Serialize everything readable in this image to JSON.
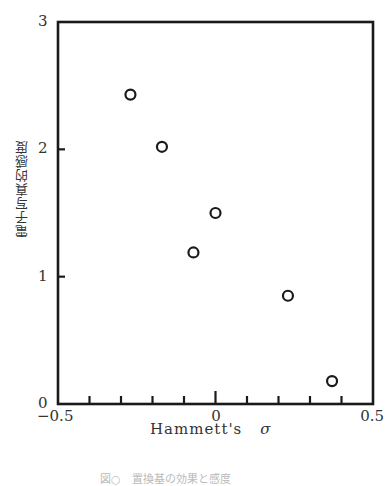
{
  "chart_data": {
    "type": "scatter",
    "title": "",
    "xlabel": "Hammett's σ",
    "xlabel_text": "Hammett's",
    "xlabel_symbol": "σ",
    "ylabel": "電子写真的感度",
    "xlim": [
      -0.5,
      0.5
    ],
    "ylim": [
      0,
      3
    ],
    "x_tick_labels": [
      "−0.5",
      "0",
      "0.5"
    ],
    "x_tick_values": [
      -0.5,
      0,
      0.5
    ],
    "x_minor_ticks": [
      -0.4,
      -0.3,
      -0.2,
      -0.1,
      0,
      0.1,
      0.2,
      0.3,
      0.4
    ],
    "y_tick_labels": [
      "0",
      "1",
      "2",
      "3"
    ],
    "y_tick_values": [
      0,
      1,
      2,
      3
    ],
    "grid": false,
    "legend": null,
    "marker": "open-circle",
    "series": [
      {
        "name": "samples",
        "points": [
          {
            "x": -0.27,
            "y": 2.43
          },
          {
            "x": -0.17,
            "y": 2.02
          },
          {
            "x": -0.07,
            "y": 1.19
          },
          {
            "x": 0.0,
            "y": 1.5
          },
          {
            "x": 0.23,
            "y": 0.85
          },
          {
            "x": 0.37,
            "y": 0.18
          }
        ]
      }
    ]
  },
  "caption": "図○　置換基の効果と感度"
}
